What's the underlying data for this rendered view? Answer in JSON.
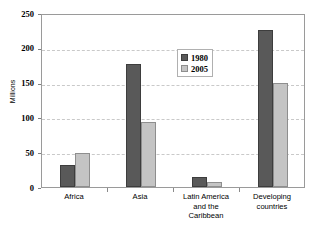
{
  "chart_data": {
    "type": "bar",
    "title": "",
    "xlabel": "",
    "ylabel": "Millions",
    "categories": [
      "Africa",
      "Asia",
      "Latin America\nand the\nCaribbean",
      "Developing\ncountries"
    ],
    "series": [
      {
        "name": "1980",
        "color": "#595959",
        "values": [
          32,
          177,
          14,
          225
        ]
      },
      {
        "name": "2005",
        "color": "#c4c4c4",
        "values": [
          49,
          93,
          7,
          149
        ]
      }
    ],
    "ylim": [
      0,
      250
    ],
    "yticks": [
      0,
      50,
      100,
      150,
      200,
      250
    ],
    "ytick_labels": [
      "0",
      "50",
      "100",
      "150",
      "200",
      "250"
    ],
    "grid": true,
    "grid_axis": "y",
    "grid_style": "dashed",
    "legend_position": "upper center",
    "legend_entries": [
      "1980",
      "2005"
    ],
    "plot_border": true,
    "background": "#ffffff"
  }
}
